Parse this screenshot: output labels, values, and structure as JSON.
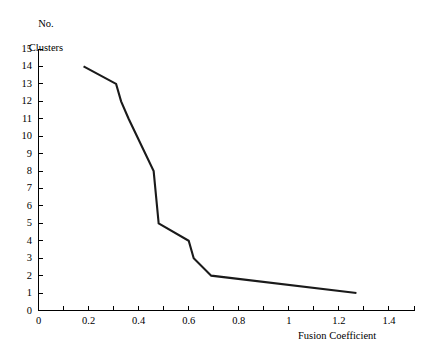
{
  "chart_data": {
    "type": "line",
    "title": "",
    "subtitle": "",
    "xlabel": "Fusion Coefficient",
    "ylabel_line1": "No.",
    "ylabel_line2": "Clusters",
    "ylabel": "No. Clusters",
    "xlim": [
      0,
      1.5
    ],
    "ylim": [
      0,
      15
    ],
    "grid": false,
    "legend": false,
    "legend_position": "none",
    "xticks_major": [
      0,
      0.2,
      0.4,
      0.6,
      0.8,
      1,
      1.2,
      1.4
    ],
    "xtick_labels": [
      "0",
      "0.2",
      "0.4",
      "0.6",
      "0.8",
      "1",
      "1.2",
      "1.4"
    ],
    "xticks_minor": [
      0.1,
      0.3,
      0.5,
      0.7,
      0.9,
      1.1,
      1.3,
      1.5
    ],
    "yticks_major": [
      0,
      1,
      2,
      3,
      4,
      5,
      6,
      7,
      8,
      9,
      10,
      11,
      12,
      13,
      14,
      15
    ],
    "ytick_labels": [
      "0",
      "1",
      "2",
      "3",
      "4",
      "5",
      "6",
      "7",
      "8",
      "9",
      "10",
      "11",
      "12",
      "13",
      "14",
      "15"
    ],
    "series": [
      {
        "name": "Fusion dendrogram scree",
        "color": "#1a1a1a",
        "x": [
          0.18,
          0.31,
          0.33,
          0.36,
          0.46,
          0.48,
          0.6,
          0.62,
          0.69,
          1.27
        ],
        "y": [
          14,
          13,
          12,
          11,
          8,
          5,
          4,
          3,
          2,
          1
        ]
      }
    ],
    "annotations": []
  },
  "axes": {
    "x_axis_name": "x-axis",
    "y_axis_name": "y-axis"
  }
}
